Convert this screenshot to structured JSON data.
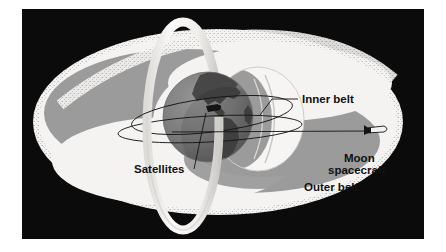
{
  "figure": {
    "background_color": "#0b0b0b",
    "margin_color": "#ffffff"
  },
  "palette": {
    "panel_black": "#0b0b0b",
    "belt_white": "#f4f3f1",
    "belt_gray": "#9b9b9b",
    "belt_gray_dark": "#8d8d8d",
    "ring_white": "#f6f5f3",
    "ring_shadow": "#cfcecb",
    "earth_ocean": "#7d7d7d",
    "earth_land": "#474747",
    "line_black": "#141414",
    "label_text": "#111111"
  },
  "labels": [
    {
      "id": "inner-belt",
      "text": "Inner belt",
      "x": 300,
      "y": 94
    },
    {
      "id": "moon-spacecraft-1",
      "text": "Moon",
      "x": 318,
      "y": 152
    },
    {
      "id": "moon-spacecraft-2",
      "text": "spacecraft",
      "x": 305,
      "y": 164
    },
    {
      "id": "outer-belt",
      "text": "Outer belt",
      "x": 289,
      "y": 178
    },
    {
      "id": "satellites",
      "text": "Satellites",
      "x": 139,
      "y": 163
    }
  ],
  "label_text": {
    "inner_belt": "Inner belt",
    "moon_line1": "Moon",
    "moon_line2": "spacecraft",
    "outer_belt": "Outer belt",
    "satellites": "Satellites"
  },
  "diagram_elements": {
    "outer_belt": {
      "name": "outer-belt-region",
      "shape": "ellipse",
      "description": "Large outer radiation belt, white stippled rim with gray interior"
    },
    "inner_belt": {
      "name": "inner-belt-region",
      "shape": "lens",
      "description": "Smaller crescent-shaped inner radiation belt near Earth"
    },
    "earth": {
      "name": "earth-globe",
      "shape": "sphere",
      "description": "Earth showing North and South America"
    },
    "orbital_ring": {
      "name": "orbital-ring",
      "shape": "torus",
      "description": "Vertical white ring encircling Earth"
    },
    "spacecraft": {
      "name": "moon-spacecraft-marker",
      "shape": "rocket",
      "description": "Small rocket icon at right on trajectory line"
    },
    "satellite": {
      "name": "satellite-marker",
      "shape": "dot",
      "description": "Dark satellite marker on orbit at Earth"
    }
  },
  "leader_lines": [
    {
      "id": "inner-belt-leader",
      "from": "Inner belt label",
      "to": "inner belt crescent"
    },
    {
      "id": "satellites-leader",
      "from": "Satellites label",
      "to": "satellite marker at Earth"
    },
    {
      "id": "spacecraft-leader",
      "from": "satellite orbit region",
      "to": "Moon spacecraft rocket"
    }
  ]
}
